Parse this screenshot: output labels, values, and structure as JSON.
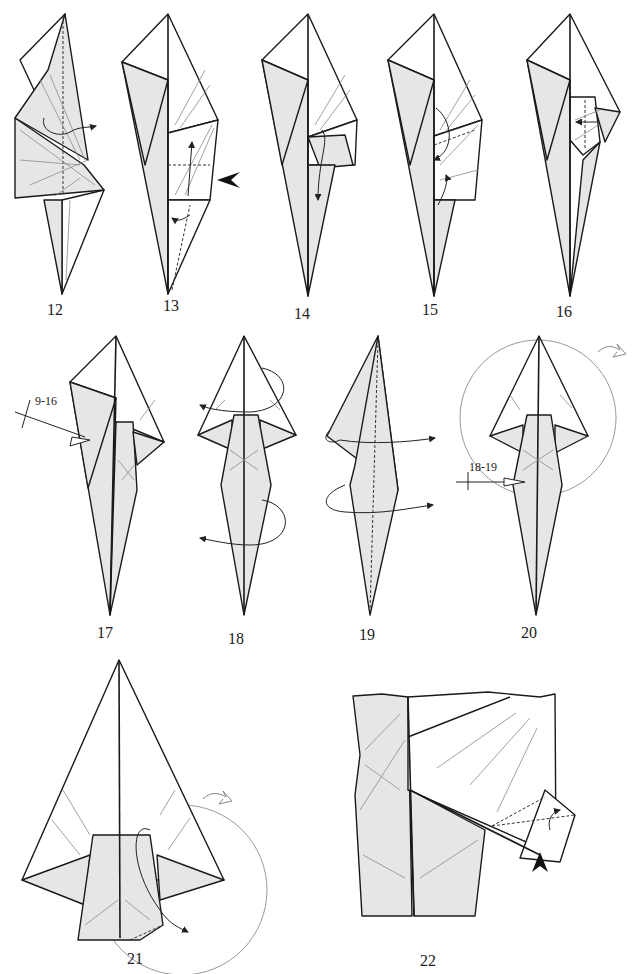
{
  "page": {
    "type": "origami-instructions",
    "background": "#ffffff",
    "paper_colored_side": "#e6e6e6",
    "paper_white_side": "#ffffff"
  },
  "steps": [
    {
      "number": "12",
      "label": "12",
      "symbols": [
        "valley-fold-line",
        "turn-over-flap-arrow"
      ]
    },
    {
      "number": "13",
      "label": "13",
      "symbols": [
        "valley-fold-line",
        "push-arrow",
        "fold-arrow"
      ]
    },
    {
      "number": "14",
      "label": "14",
      "symbols": [
        "valley-fold-line",
        "fold-arrow"
      ]
    },
    {
      "number": "15",
      "label": "15",
      "symbols": [
        "valley-fold-line",
        "fold-arrow"
      ]
    },
    {
      "number": "16",
      "label": "16",
      "symbols": [
        "valley-fold-line",
        "fold-arrow"
      ]
    },
    {
      "number": "17",
      "label": "17",
      "ref_label": "9-16",
      "symbols": [
        "repeat-steps-arrow"
      ]
    },
    {
      "number": "18",
      "label": "18",
      "symbols": [
        "fold-behind-arrow",
        "fold-behind-arrow"
      ]
    },
    {
      "number": "19",
      "label": "19",
      "symbols": [
        "valley-fold-line",
        "fold-behind-arrow",
        "fold-behind-arrow"
      ]
    },
    {
      "number": "20",
      "label": "20",
      "ref_label": "18-19",
      "symbols": [
        "repeat-steps-arrow",
        "zoom-circle",
        "turn-over-arrow"
      ]
    },
    {
      "number": "21",
      "label": "21",
      "symbols": [
        "zoom-circle",
        "turn-over-arrow",
        "fold-arrow"
      ]
    },
    {
      "number": "22",
      "label": "22",
      "symbols": [
        "push-arrow",
        "valley-fold-line",
        "fold-arrow"
      ]
    }
  ]
}
